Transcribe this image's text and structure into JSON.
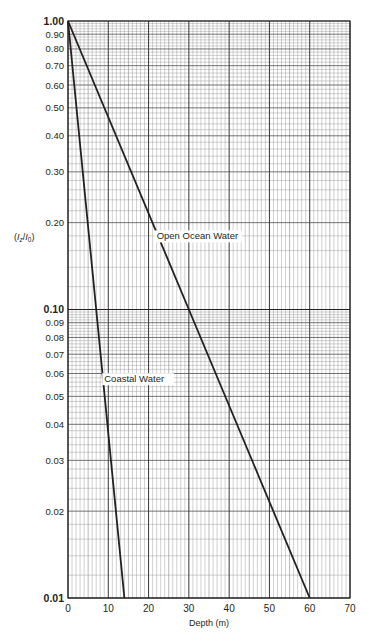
{
  "chart_data": {
    "type": "line",
    "title": "",
    "xlabel": "Depth (m)",
    "ylabel": "(Iz/I0)",
    "ylabel_parts": {
      "open": "(",
      "I1": "I",
      "sub1": "z",
      "slash": "/",
      "I2": "I",
      "sub2": "0",
      "close": ")"
    },
    "xlim": [
      0,
      70
    ],
    "ylim": [
      0.01,
      1.0
    ],
    "yscale": "log",
    "grid": true,
    "x_ticks": [
      0,
      10,
      20,
      30,
      40,
      50,
      60,
      70
    ],
    "x_tick_labels": [
      "0",
      "10",
      "20",
      "30",
      "40",
      "50",
      "60",
      "70"
    ],
    "y_ticks": [
      1.0,
      0.9,
      0.8,
      0.7,
      0.6,
      0.5,
      0.4,
      0.3,
      0.2,
      0.1,
      0.09,
      0.08,
      0.07,
      0.06,
      0.05,
      0.04,
      0.03,
      0.02,
      0.01
    ],
    "y_tick_labels": [
      "1.00",
      "0.90",
      "0.80",
      "0.70",
      "0.60",
      "0.50",
      "0.40",
      "0.30",
      "0.20",
      "0.10",
      "0.09",
      "0.08",
      "0.07",
      "0.06",
      "0.05",
      "0.04",
      "0.03",
      "0.02",
      "0.01"
    ],
    "y_tick_bold": [
      "1.00",
      "0.10",
      "0.01"
    ],
    "series": [
      {
        "name": "Open Ocean Water",
        "x": [
          0,
          30,
          60
        ],
        "y": [
          1.0,
          0.1,
          0.01
        ],
        "label_pos": {
          "x": 22,
          "y": 0.175
        }
      },
      {
        "name": "Coastal Water",
        "x": [
          0,
          7,
          14
        ],
        "y": [
          1.0,
          0.1,
          0.01
        ],
        "label_pos": {
          "x": 9,
          "y": 0.056
        }
      }
    ],
    "colors": {
      "line": "#231f20",
      "grid_major": "#231f20",
      "grid_minor": "#8a8a8a"
    }
  }
}
